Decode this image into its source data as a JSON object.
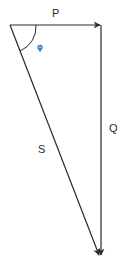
{
  "diagram": {
    "type": "vector-triangle",
    "vectors": [
      {
        "id": "P",
        "label": "P",
        "direction": "right",
        "arrowhead": true
      },
      {
        "id": "Q",
        "label": "Q",
        "direction": "down",
        "arrowhead": true
      },
      {
        "id": "S",
        "label": "S",
        "direction": "down-right",
        "arrowhead": true
      }
    ],
    "angle": {
      "label": "φ",
      "between": [
        "P",
        "S"
      ]
    },
    "colors": {
      "line": "#2a2a2a",
      "background": "#ffffff"
    }
  }
}
